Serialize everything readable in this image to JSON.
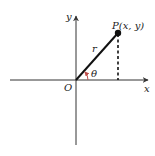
{
  "diagram": {
    "axes": {
      "x_label": "x",
      "y_label": "y",
      "origin_label": "O"
    },
    "point": {
      "label": "P(x, y)"
    },
    "radius_label": "r",
    "angle_label": "θ",
    "colors": {
      "line": "#111111",
      "axis": "#333333",
      "angle_arc": "#c0504d"
    }
  }
}
